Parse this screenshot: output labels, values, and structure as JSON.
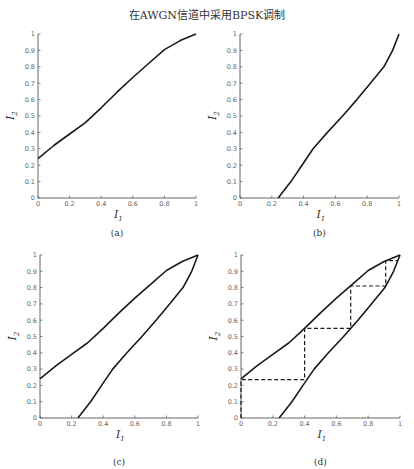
{
  "title": "在AWGN信道中采用BPSK调制",
  "chart_data": [
    {
      "type": "line",
      "caption": "(a)",
      "xlabel": "I1",
      "ylabel": "I2",
      "xlim": [
        0,
        1
      ],
      "ylim": [
        0,
        1
      ],
      "xticks": [
        "0",
        "0.2",
        "0.4",
        "0.6",
        "0.8",
        "1"
      ],
      "yticks": [
        "0",
        "0.1",
        "0.2",
        "0.3",
        "0.4",
        "0.5",
        "0.6",
        "0.7",
        "0.8",
        "0.9",
        "1"
      ],
      "series": [
        {
          "name": "decoder 1 transfer curve",
          "style": "solid",
          "x": [
            0,
            0.1,
            0.2,
            0.3,
            0.4,
            0.5,
            0.6,
            0.7,
            0.8,
            0.9,
            1.0
          ],
          "y": [
            0.24,
            0.32,
            0.39,
            0.46,
            0.55,
            0.645,
            0.735,
            0.82,
            0.905,
            0.96,
            1.0
          ]
        }
      ]
    },
    {
      "type": "line",
      "caption": "(b)",
      "xlabel": "I1",
      "ylabel": "I2",
      "xlim": [
        0,
        1
      ],
      "ylim": [
        0,
        1
      ],
      "xticks": [
        "0",
        "0.2",
        "0.4",
        "0.6",
        "0.8",
        "1"
      ],
      "yticks": [
        "0",
        "0.1",
        "0.2",
        "0.3",
        "0.4",
        "0.5",
        "0.6",
        "0.7",
        "0.8",
        "0.9",
        "1"
      ],
      "series": [
        {
          "name": "decoder 2 transfer curve (inverted)",
          "style": "solid",
          "x": [
            0.24,
            0.32,
            0.39,
            0.46,
            0.55,
            0.645,
            0.735,
            0.82,
            0.905,
            0.96,
            1.0
          ],
          "y": [
            0,
            0.1,
            0.2,
            0.3,
            0.4,
            0.5,
            0.6,
            0.7,
            0.8,
            0.9,
            1.0
          ]
        }
      ]
    },
    {
      "type": "line",
      "caption": "(c)",
      "xlabel": "I1",
      "ylabel": "I2",
      "xlim": [
        0,
        1
      ],
      "ylim": [
        0,
        1
      ],
      "xticks": [
        "0",
        "0.2",
        "0.4",
        "0.6",
        "0.8",
        "1"
      ],
      "yticks": [
        "0",
        "0.1",
        "0.2",
        "0.3",
        "0.4",
        "0.5",
        "0.6",
        "0.7",
        "0.8",
        "0.9",
        "1"
      ],
      "series": [
        {
          "name": "decoder 1 transfer curve",
          "style": "solid",
          "x": [
            0,
            0.1,
            0.2,
            0.3,
            0.4,
            0.5,
            0.6,
            0.7,
            0.8,
            0.9,
            1.0
          ],
          "y": [
            0.24,
            0.32,
            0.39,
            0.46,
            0.55,
            0.645,
            0.735,
            0.82,
            0.905,
            0.96,
            1.0
          ]
        },
        {
          "name": "decoder 2 transfer curve (inverted)",
          "style": "solid",
          "x": [
            0.24,
            0.32,
            0.39,
            0.46,
            0.55,
            0.645,
            0.735,
            0.82,
            0.905,
            0.96,
            1.0
          ],
          "y": [
            0,
            0.1,
            0.2,
            0.3,
            0.4,
            0.5,
            0.6,
            0.7,
            0.8,
            0.9,
            1.0
          ]
        }
      ]
    },
    {
      "type": "line",
      "caption": "(d)",
      "xlabel": "I1",
      "ylabel": "I2",
      "xlim": [
        0,
        1
      ],
      "ylim": [
        0,
        1
      ],
      "xticks": [
        "0",
        "0.2",
        "0.4",
        "0.6",
        "0.8",
        "1"
      ],
      "yticks": [
        "0",
        "0.1",
        "0.2",
        "0.3",
        "0.4",
        "0.5",
        "0.6",
        "0.7",
        "0.8",
        "0.9",
        "1"
      ],
      "series": [
        {
          "name": "decoder 1 transfer curve",
          "style": "solid",
          "x": [
            0,
            0.1,
            0.2,
            0.3,
            0.4,
            0.5,
            0.6,
            0.7,
            0.8,
            0.9,
            1.0
          ],
          "y": [
            0.24,
            0.32,
            0.39,
            0.46,
            0.55,
            0.645,
            0.735,
            0.82,
            0.905,
            0.96,
            1.0
          ]
        },
        {
          "name": "decoder 2 transfer curve (inverted)",
          "style": "solid",
          "x": [
            0.24,
            0.32,
            0.39,
            0.46,
            0.55,
            0.645,
            0.735,
            0.82,
            0.905,
            0.96,
            1.0
          ],
          "y": [
            0,
            0.1,
            0.2,
            0.3,
            0.4,
            0.5,
            0.6,
            0.7,
            0.8,
            0.9,
            1.0
          ]
        },
        {
          "name": "decoding trajectory",
          "style": "dashed",
          "x": [
            0,
            0,
            0.4,
            0.4,
            0.69,
            0.69,
            0.91,
            0.91,
            0.985
          ],
          "y": [
            0,
            0.235,
            0.235,
            0.55,
            0.55,
            0.81,
            0.81,
            0.965,
            0.965
          ]
        }
      ]
    }
  ],
  "layout": {
    "panels": [
      {
        "x0": 38,
        "x1": 196,
        "y0": 198,
        "y1": 34,
        "caption_y": 236
      },
      {
        "x0": 240,
        "x1": 399,
        "y0": 198,
        "y1": 34,
        "caption_y": 236
      },
      {
        "x0": 40,
        "x1": 198,
        "y0": 418,
        "y1": 255,
        "caption_y": 465
      },
      {
        "x0": 241,
        "x1": 400,
        "y0": 418,
        "y1": 255,
        "caption_y": 465
      }
    ],
    "line_color": "#1a1a1a",
    "axis_color": "#555555"
  }
}
